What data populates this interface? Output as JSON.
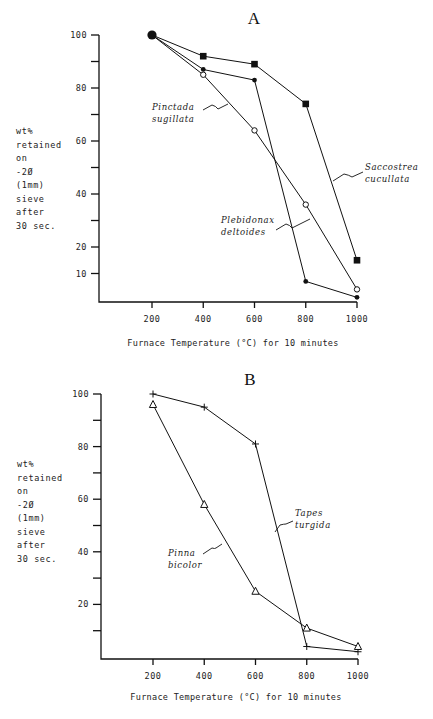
{
  "chart_data": [
    {
      "type": "line",
      "panel": "A",
      "title": "A",
      "xlabel": "Furnace Temperature (°C) for 10 minutes",
      "ylabel_lines": [
        "wt%",
        "retained",
        "on",
        "-2Ø",
        "(1mm)",
        "sieve",
        "after",
        "30 sec."
      ],
      "x": [
        200,
        400,
        600,
        800,
        1000
      ],
      "x_ticks": [
        "200",
        "400",
        "600",
        "800",
        "1000"
      ],
      "y_ticks_labeled": [
        "100",
        "80",
        "60",
        "40",
        "20",
        "10"
      ],
      "y_tick_values": [
        100,
        90,
        80,
        70,
        60,
        50,
        40,
        30,
        20,
        10
      ],
      "y_tick_label_values": [
        100,
        80,
        60,
        40,
        20,
        10
      ],
      "xlim": [
        0,
        1000
      ],
      "ylim": [
        0,
        100
      ],
      "grid": false,
      "shared_start": {
        "x": 200,
        "y": 100,
        "marker": "large-filled-circle"
      },
      "series": [
        {
          "name": "Saccostrea cucullata",
          "label_lines": [
            "Saccostrea",
            "cucullata"
          ],
          "marker": "filled-square",
          "values": [
            100,
            92,
            89,
            74,
            15
          ]
        },
        {
          "name": "Plebidonax deltoides",
          "label_lines": [
            "Plebidonax",
            "deltoides"
          ],
          "marker": "filled-circle",
          "values": [
            100,
            87,
            83,
            7,
            1
          ]
        },
        {
          "name": "Pinctada sugillata",
          "label_lines": [
            "Pinctada",
            "sugillata"
          ],
          "marker": "open-circle",
          "values": [
            100,
            85,
            64,
            36,
            4
          ]
        }
      ]
    },
    {
      "type": "line",
      "panel": "B",
      "title": "B",
      "xlabel": "Furnace Temperature (°C) for 10 minutes",
      "ylabel_lines": [
        "wt%",
        "retained",
        "on",
        "-2Ø",
        "(1mm)",
        "sieve",
        "after",
        "30 sec."
      ],
      "x": [
        200,
        400,
        600,
        800,
        1000
      ],
      "x_ticks": [
        "200",
        "400",
        "600",
        "800",
        "1000"
      ],
      "y_ticks_labeled": [
        "100",
        "80",
        "60",
        "40",
        "20"
      ],
      "y_tick_values": [
        100,
        90,
        80,
        70,
        60,
        50,
        40,
        30,
        20,
        10
      ],
      "y_tick_label_values": [
        100,
        80,
        60,
        40,
        20
      ],
      "xlim": [
        0,
        1000
      ],
      "ylim": [
        0,
        100
      ],
      "grid": false,
      "series": [
        {
          "name": "Tapes turgida",
          "label_lines": [
            "Tapes",
            "turgida"
          ],
          "marker": "plus",
          "values": [
            100,
            95,
            81,
            4,
            2
          ]
        },
        {
          "name": "Pinna bicolor",
          "label_lines": [
            "Pinna",
            "bicolor"
          ],
          "marker": "open-triangle",
          "values": [
            96,
            58,
            25,
            11,
            4
          ]
        }
      ]
    }
  ]
}
